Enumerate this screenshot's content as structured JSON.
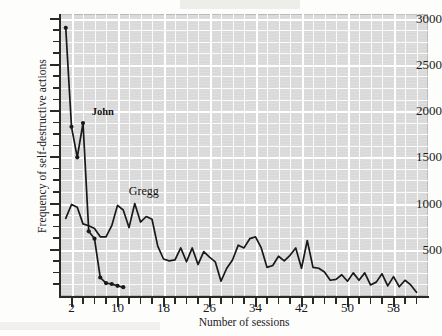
{
  "axes": {
    "ylabel": "Frequency of self-destructive actions",
    "xlabel": "Number of sessions",
    "yticks": [
      500,
      1000,
      1500,
      2000,
      2500,
      3000
    ],
    "xticks": [
      2,
      10,
      18,
      26,
      34,
      42,
      50,
      58
    ]
  },
  "annotations": {
    "john": "John",
    "gregg": "Gregg"
  },
  "colors": {
    "plot_background": "#d9d9d9",
    "gridline": "#ffffff",
    "series_line": "#1b1917",
    "axis": "#2b2926",
    "text": "#1d1b19"
  },
  "chart_data": {
    "type": "line",
    "title": "",
    "xlabel": "Number of sessions",
    "ylabel": "Frequency of self-destructive actions",
    "xlim": [
      0,
      64
    ],
    "ylim": [
      0,
      3050
    ],
    "xticks": [
      2,
      10,
      18,
      26,
      34,
      42,
      50,
      58
    ],
    "yticks": [
      500,
      1000,
      1500,
      2000,
      2500,
      3000
    ],
    "grid": true,
    "legend": "none (series labeled inline)",
    "annotations": [
      {
        "text": "John",
        "x": 5,
        "y": 1980
      },
      {
        "text": "Gregg",
        "x": 13,
        "y": 1120
      }
    ],
    "series": [
      {
        "name": "John",
        "markers": true,
        "x": [
          1,
          2,
          3,
          4,
          5,
          6,
          7,
          8,
          9,
          10,
          11
        ],
        "y": [
          2900,
          1830,
          1500,
          1870,
          700,
          620,
          200,
          140,
          130,
          110,
          95
        ]
      },
      {
        "name": "Gregg",
        "markers": false,
        "x": [
          1,
          2,
          3,
          4,
          5,
          6,
          7,
          8,
          9,
          10,
          11,
          12,
          13,
          14,
          15,
          16,
          17,
          18,
          19,
          20,
          21,
          22,
          23,
          24,
          25,
          26,
          27,
          28,
          29,
          30,
          31,
          32,
          33,
          34,
          35,
          36,
          37,
          38,
          39,
          40,
          41,
          42,
          43,
          44,
          45,
          46,
          47,
          48,
          49,
          50,
          51,
          52,
          53,
          54,
          55,
          56,
          57,
          58,
          59,
          60,
          61,
          62
        ],
        "y": [
          840,
          990,
          960,
          780,
          760,
          730,
          640,
          640,
          760,
          980,
          930,
          740,
          1000,
          800,
          860,
          830,
          540,
          400,
          380,
          390,
          520,
          370,
          520,
          340,
          480,
          420,
          370,
          160,
          300,
          390,
          550,
          520,
          620,
          640,
          520,
          310,
          330,
          430,
          380,
          440,
          520,
          300,
          600,
          310,
          300,
          260,
          170,
          180,
          230,
          160,
          250,
          170,
          250,
          120,
          150,
          240,
          110,
          210,
          100,
          170,
          120,
          40
        ]
      }
    ]
  }
}
